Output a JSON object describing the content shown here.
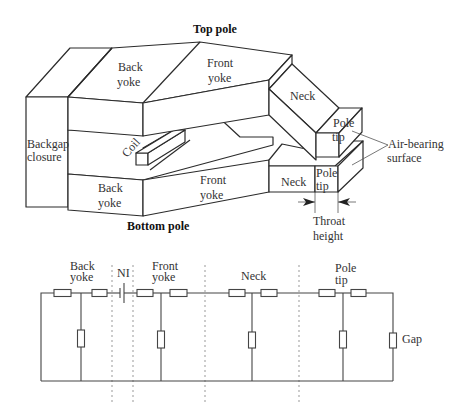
{
  "head_diagram": {
    "labels": {
      "top_pole": "Top pole",
      "bottom_pole": "Bottom pole",
      "top_back_yoke_1": "Back",
      "top_back_yoke_2": "yoke",
      "top_front_yoke_1": "Front",
      "top_front_yoke_2": "yoke",
      "top_neck": "Neck",
      "top_pole_tip_1": "Pole",
      "top_pole_tip_2": "tip",
      "backgap_1": "Backgap",
      "backgap_2": "closure",
      "coil": "Coil",
      "bottom_back_yoke_1": "Back",
      "bottom_back_yoke_2": "yoke",
      "bottom_front_yoke_1": "Front",
      "bottom_front_yoke_2": "yoke",
      "bottom_neck": "Neck",
      "bottom_pole_tip_1": "Pole",
      "bottom_pole_tip_2": "tip",
      "abs_1": "Air-bearing",
      "abs_2": "surface",
      "throat_1": "Throat",
      "throat_2": "height"
    }
  },
  "circuit": {
    "labels": {
      "back_yoke_1": "Back",
      "back_yoke_2": "yoke",
      "ni": "NI",
      "front_yoke_1": "Front",
      "front_yoke_2": "yoke",
      "neck": "Neck",
      "pole_tip_1": "Pole",
      "pole_tip_2": "tip",
      "gap": "Gap"
    },
    "sections": [
      "Back yoke",
      "NI",
      "Front yoke",
      "Neck",
      "Pole tip",
      "Gap"
    ]
  }
}
